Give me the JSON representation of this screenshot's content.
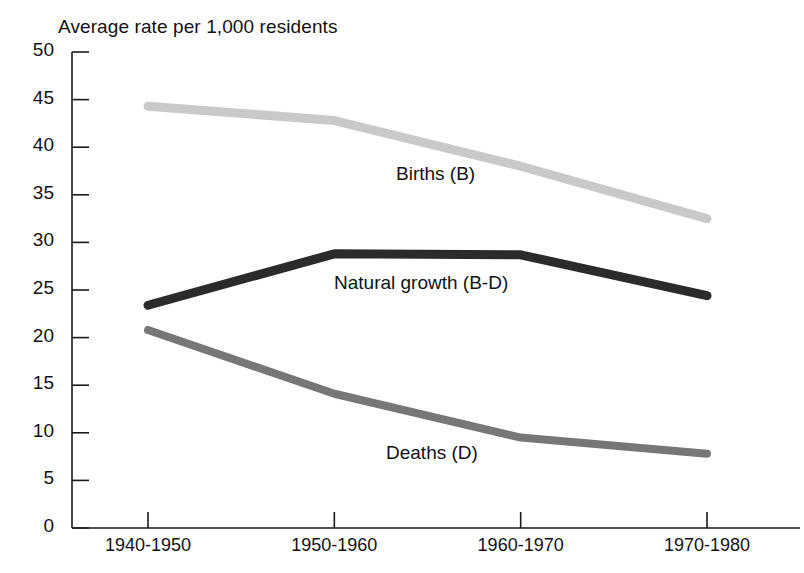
{
  "chart_data": {
    "type": "line",
    "title": "Average rate per 1,000 residents",
    "xlabel": "",
    "ylabel": "",
    "categories": [
      "1940-1950",
      "1950-1960",
      "1960-1970",
      "1970-1980"
    ],
    "ylim": [
      0,
      50
    ],
    "yticks": [
      0,
      5,
      10,
      15,
      20,
      25,
      30,
      35,
      40,
      45,
      50
    ],
    "ytick_labels": [
      "0",
      "5",
      "10",
      "15",
      "20",
      "25",
      "30",
      "35",
      "40",
      "45",
      "50"
    ],
    "grid": false,
    "legend_position": "inline-annotations",
    "series": [
      {
        "name": "Births (B)",
        "label": "Births (B)",
        "color": "#c9c9c9",
        "line_width": 9,
        "values": [
          44.3,
          42.8,
          38.0,
          32.5
        ]
      },
      {
        "name": "Natural growth (B-D)",
        "label": "Natural growth (B-D)",
        "color": "#2b2b2b",
        "line_width": 9,
        "values": [
          23.4,
          28.8,
          28.7,
          24.4
        ]
      },
      {
        "name": "Deaths (D)",
        "label": "Deaths (D)",
        "color": "#777777",
        "line_width": 8,
        "values": [
          20.8,
          14.1,
          9.5,
          7.8
        ]
      }
    ],
    "annotations": [
      {
        "text": "Births (B)",
        "x": 1,
        "y": 35.5
      },
      {
        "text": "Natural growth (B-D)",
        "x": 1,
        "y": 26.5
      },
      {
        "text": "Deaths (D)",
        "x": 1,
        "y": 9.0
      }
    ]
  },
  "axis": {
    "y_labels": [
      "50",
      "45",
      "40",
      "35",
      "30",
      "25",
      "20",
      "15",
      "10",
      "5",
      "0"
    ],
    "x_labels": [
      "1940-1950",
      "1950-1960",
      "1960-1970",
      "1970-1980"
    ]
  },
  "labels": {
    "title": "Average rate per 1,000 residents",
    "births": "Births (B)",
    "natural_growth": "Natural growth (B-D)",
    "deaths": "Deaths (D)"
  },
  "colors": {
    "births": "#c9c9c9",
    "natural_growth": "#2b2b2b",
    "deaths": "#777777",
    "axis": "#1a1a1a",
    "background": "#ffffff"
  }
}
